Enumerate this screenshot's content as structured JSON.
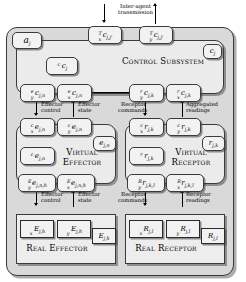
{
  "diagram": {
    "agent_label": "a_j",
    "control_subsystem": {
      "title": "Control Subsystem",
      "corner_label": "c_j",
      "internal_box": "c_cj",
      "transmission_note": "Inter-agent transmission",
      "tx_box": "T_x c_j,j'",
      "ty_box": "T_y c_j,j'",
      "ports": [
        {
          "label": "e_y c_j,n"
        },
        {
          "label": "e_x c_j,n"
        },
        {
          "label": "r_y c_j,k"
        },
        {
          "label": "r_x c_j,k"
        }
      ]
    },
    "virtual_effector": {
      "title": "Virtual Effector",
      "corner_label": "e_j,n",
      "internal_box": "c_e_j,n",
      "top_ports": [
        {
          "label": "c_x e_j,n"
        },
        {
          "label": "c_y e_j,n"
        }
      ],
      "bottom_ports": [
        {
          "label": "E_y e_j,n,h"
        },
        {
          "label": "E_x e_j,n,h"
        }
      ]
    },
    "virtual_receptor": {
      "title": "Virtual Receptor",
      "corner_label": "r_j,k",
      "internal_box": "r_r_j,k",
      "top_ports": [
        {
          "label": "c_x r_j,k"
        },
        {
          "label": "c_y r_j,k"
        }
      ],
      "bottom_ports": [
        {
          "label": "R_y r_j,k,l"
        },
        {
          "label": "R_x r_j,k,l"
        }
      ]
    },
    "real_effector": {
      "title": "Real Effector",
      "corner_label": "E_j,h",
      "ports": [
        {
          "label": "x E_j,h"
        },
        {
          "label": "y E_j,h"
        }
      ]
    },
    "real_receptor": {
      "title": "Real Receptor",
      "corner_label": "R_j,l",
      "ports": [
        {
          "label": "x R_j,l"
        },
        {
          "label": "y R_j,l"
        }
      ]
    },
    "annotations": {
      "effector_control_upper": "Effector\ncontrol",
      "effector_state_upper": "Effector\nstate",
      "receptor_commands_upper": "Receptor\ncommands",
      "aggregated_readings": "Aggregated\nreadings",
      "effector_control_lower": "Effector\ncontrol",
      "effector_state_lower": "Effector\nstate",
      "receptor_commands_lower": "Receptor\ncommands",
      "receptor_readings": "Receptor\nreadings"
    },
    "annotation_lines": {
      "inter_agent_1": "Inter-agent",
      "inter_agent_2": "transmission",
      "effector_1": "Effector",
      "control_2": "control",
      "state_2": "state",
      "receptor_1": "Receptor",
      "commands_2": "commands",
      "aggregated_1": "Aggregated",
      "readings_2": "readings",
      "receptor_readings_1": "Receptor",
      "receptor_readings_2": "readings"
    },
    "colors": {
      "agent_bg": "#d9d9d9",
      "subsystem_bg": "#ebebeb",
      "box_bg": "#f2f2f2",
      "stroke": "#3a3a3a"
    }
  }
}
